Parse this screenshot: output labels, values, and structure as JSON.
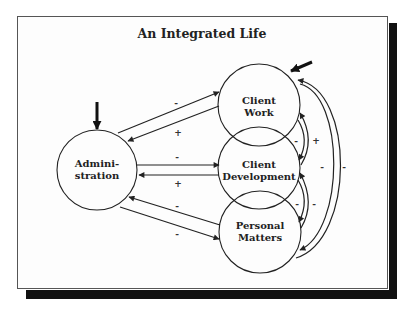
{
  "title": "An Integrated Life",
  "nodes": [
    {
      "id": "administration",
      "label_lines": [
        "Admini-",
        "stration"
      ],
      "cx": 97,
      "cy": 170,
      "r": 40
    },
    {
      "id": "client_work",
      "label_lines": [
        "Client",
        "Work"
      ],
      "cx": 259,
      "cy": 105,
      "r": 41
    },
    {
      "id": "client_development",
      "label_lines": [
        "Client",
        "Development"
      ],
      "cx": 259,
      "cy": 168,
      "r": 41
    },
    {
      "id": "personal_matters",
      "label_lines": [
        "Personal",
        "Matters"
      ],
      "cx": 260,
      "cy": 232,
      "r": 41
    }
  ],
  "external_inputs": [
    {
      "target": "administration",
      "direction": "from-top"
    },
    {
      "target": "client_work",
      "direction": "from-upper-right"
    }
  ],
  "edges": [
    {
      "from": "administration",
      "to": "client_work",
      "sign": "-"
    },
    {
      "from": "client_work",
      "to": "administration",
      "sign": "+"
    },
    {
      "from": "administration",
      "to": "client_development",
      "sign": "-"
    },
    {
      "from": "client_development",
      "to": "administration",
      "sign": "+"
    },
    {
      "from": "personal_matters",
      "to": "administration",
      "sign": "-"
    },
    {
      "from": "administration",
      "to": "personal_matters",
      "sign": "-"
    },
    {
      "from": "client_work",
      "to": "client_development",
      "sign": "-"
    },
    {
      "from": "client_development",
      "to": "client_work",
      "sign": "+"
    },
    {
      "from": "client_development",
      "to": "personal_matters",
      "sign": "-"
    },
    {
      "from": "personal_matters",
      "to": "client_development",
      "sign": "-"
    },
    {
      "from": "client_work",
      "to": "personal_matters",
      "sign": "-"
    },
    {
      "from": "personal_matters",
      "to": "client_work",
      "sign": "-"
    }
  ],
  "labels": {
    "admin_cw_minus": "-",
    "admin_cw_plus": "+",
    "admin_cd_minus": "-",
    "admin_cd_plus": "+",
    "admin_pm_minus_top": "-",
    "admin_pm_minus_bottom": "-",
    "cw_cd_minus": "-",
    "cw_cd_plus": "+",
    "cd_pm_minus_a": "-",
    "cd_pm_minus_b": "-",
    "cw_pm_minus_a": "-",
    "cw_pm_minus_b": "-"
  }
}
